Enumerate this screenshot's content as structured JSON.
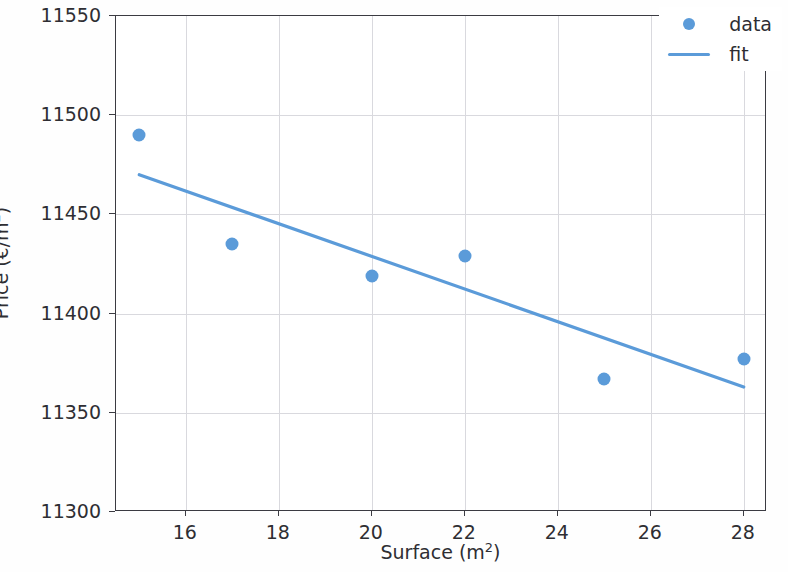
{
  "chart_data": {
    "type": "scatter",
    "title": "",
    "xlabel": "Surface (m²)",
    "ylabel": "Price (€/m²)",
    "xlim": [
      14.5,
      28.5
    ],
    "ylim": [
      11300,
      11550
    ],
    "xticks": [
      16,
      18,
      20,
      22,
      24,
      26,
      28
    ],
    "yticks": [
      11300,
      11350,
      11400,
      11450,
      11500,
      11550
    ],
    "xticklabels": [
      "16",
      "18",
      "20",
      "22",
      "24",
      "26",
      "28"
    ],
    "yticklabels": [
      "11300",
      "11350",
      "11400",
      "11450",
      "11500",
      "11550"
    ],
    "grid": true,
    "legend_position": "upper right",
    "series": [
      {
        "name": "data",
        "type": "scatter",
        "marker": "circle",
        "color": "#5b9bd9",
        "x": [
          15,
          17,
          20,
          22,
          25,
          28
        ],
        "y": [
          11490,
          11435,
          11419,
          11429,
          11367,
          11377
        ]
      },
      {
        "name": "fit",
        "type": "line",
        "color": "#5b9bd9",
        "x": [
          15,
          28
        ],
        "y": [
          11470,
          11363
        ]
      }
    ]
  },
  "legend": {
    "entries": [
      {
        "label": "data",
        "symbol": "marker-dot",
        "color": "#5b9bd9"
      },
      {
        "label": "fit",
        "symbol": "line-segment",
        "color": "#5b9bd9"
      }
    ]
  },
  "axes": {
    "x_title": "Surface (m",
    "x_title_sup": "2",
    "x_title_end": ")",
    "y_title": "Price (€/m",
    "y_title_sup": "2",
    "y_title_end": ")"
  },
  "style": {
    "accent_color": "#5b9bd9",
    "axis_color": "#3b3b42",
    "grid_color": "#d9d9de",
    "text_color": "#2e2e33",
    "background": "#ffffff"
  }
}
